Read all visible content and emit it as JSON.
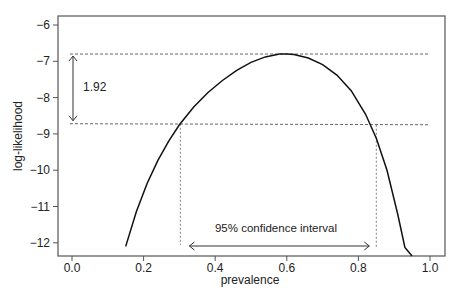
{
  "chart_data": {
    "type": "line",
    "title": "",
    "xlabel": "prevalence",
    "ylabel": "log-likelihood",
    "xlim": [
      -0.04,
      1.04
    ],
    "ylim": [
      -12.25,
      -5.75
    ],
    "x_ticks": [
      "0.0",
      "0.2",
      "0.4",
      "0.6",
      "0.8",
      "1.0"
    ],
    "x_tick_values": [
      0.0,
      0.2,
      0.4,
      0.6,
      0.8,
      1.0
    ],
    "y_ticks": [
      "−6",
      "−7",
      "−8",
      "−9",
      "−10",
      "−11",
      "−12"
    ],
    "y_tick_values": [
      -6,
      -7,
      -8,
      -9,
      -10,
      -11,
      -12
    ],
    "grid": false,
    "series": [
      {
        "name": "log-likelihood curve",
        "x": [
          0.15,
          0.18,
          0.21,
          0.24,
          0.27,
          0.3,
          0.34,
          0.38,
          0.42,
          0.46,
          0.5,
          0.54,
          0.58,
          0.6,
          0.62,
          0.66,
          0.7,
          0.74,
          0.78,
          0.82,
          0.85,
          0.88,
          0.91,
          0.93,
          0.95
        ],
        "y": [
          -12.1,
          -11.14,
          -10.36,
          -9.73,
          -9.2,
          -8.75,
          -8.26,
          -7.86,
          -7.53,
          -7.25,
          -7.03,
          -6.88,
          -6.8,
          -6.8,
          -6.81,
          -6.91,
          -7.09,
          -7.38,
          -7.81,
          -8.46,
          -9.12,
          -10.0,
          -11.22,
          -12.13,
          -12.36
        ]
      }
    ],
    "annotations": {
      "max_line_y": -6.8,
      "cutoff_line_y": -8.72,
      "difference_label": "1.92",
      "ci_label": "95% confidence interval",
      "ci_lower": 0.3,
      "ci_upper": 0.85
    }
  }
}
